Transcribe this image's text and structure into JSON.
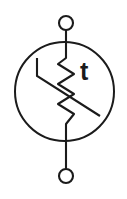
{
  "diagram": {
    "kind": "electronic-component-symbol",
    "background_color": "#ffffff",
    "stroke_color": "#1b1b1b",
    "canvas": {
      "width": 127,
      "height": 199
    },
    "label": {
      "text": "t",
      "meaning": "temperature",
      "x": 80,
      "y": 80,
      "font_size": 25
    },
    "body_circle": {
      "name": "component-outline-circle",
      "cx": 64.5,
      "cy": 91.5,
      "r": 49.5
    },
    "terminals": [
      {
        "name": "top-terminal-node",
        "cx": 66,
        "cy": 23,
        "r": 7
      },
      {
        "name": "bottom-terminal-node",
        "cx": 66,
        "cy": 176,
        "r": 7
      }
    ],
    "leads": [
      {
        "name": "top-lead-wire",
        "x1": 66,
        "y1": 30,
        "x2": 66,
        "y2": 58
      },
      {
        "name": "bottom-lead-wire",
        "x1": 66,
        "y1": 124,
        "x2": 66,
        "y2": 169
      }
    ],
    "zigzag": {
      "name": "resistor-zigzag",
      "points": "66,58 58,64 74,74 58,84 74,94 58,104 74,114 66,124",
      "peaks": 3,
      "amplitude": 8,
      "top_y": 58,
      "bottom_y": 124
    },
    "variability_arrow": {
      "name": "variability-slash-line",
      "points": "37,58 37,76 100,116",
      "description": "bent line crossing the resistor indicating dependence on temperature"
    }
  }
}
